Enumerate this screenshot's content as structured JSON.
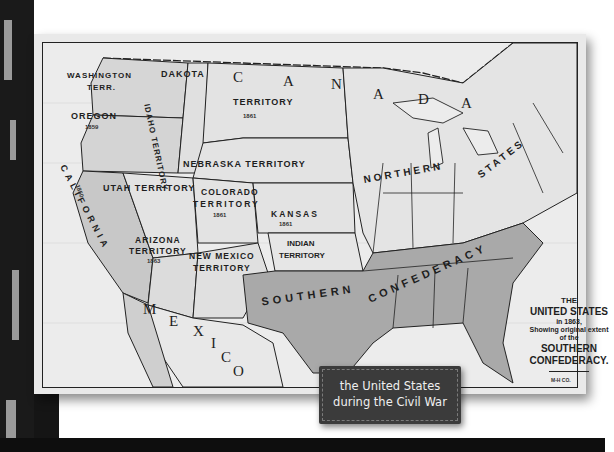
{
  "map": {
    "title_lines": [
      "THE",
      "UNITED STATES",
      "in 1863,",
      "Showing original extent",
      "of the",
      "SOUTHERN",
      "CONFEDERACY."
    ],
    "publisher_mark": "M-H CO.",
    "regions": {
      "canada": [
        "C",
        "A",
        "N",
        "A",
        "D",
        "A"
      ],
      "mexico": [
        "M",
        "E",
        "X",
        "I",
        "C",
        "O"
      ],
      "washington": "WASHINGTON",
      "washington_2": "TERR.",
      "idaho": "IDAHO TERRITORY",
      "idaho_year": "1863",
      "dakota": "DAKOTA",
      "dakota_2": "TERRITORY",
      "dakota_year": "1861",
      "oregon": "OREGON",
      "oregon_year": "1859",
      "california": "CALIFORNIA",
      "california_year": "1850",
      "utah": "UTAH TERRITORY",
      "nebraska": "NEBRASKA TERRITORY",
      "colorado": "COLORADO",
      "colorado_2": "TERRITORY",
      "colorado_year": "1861",
      "kansas": "KANSAS",
      "kansas_year": "1861",
      "arizona": "ARIZONA",
      "arizona_2": "TERRITORY",
      "arizona_year": "1863",
      "new_mexico": "NEW MEXICO",
      "new_mexico_2": "TERRITORY",
      "indian": "INDIAN",
      "indian_2": "TERRITORY",
      "northern": "NORTHERN",
      "states": "STATES",
      "southern": "SOUTHERN",
      "confederacy": "CONFEDERACY"
    },
    "colors": {
      "union": "#e3e3e3",
      "confederacy": "#a9a9a9",
      "west": "#d2d2d2",
      "water": "#ececec",
      "border": "#222222"
    }
  },
  "caption": {
    "line1": "the United States",
    "line2": "during the Civil War"
  }
}
